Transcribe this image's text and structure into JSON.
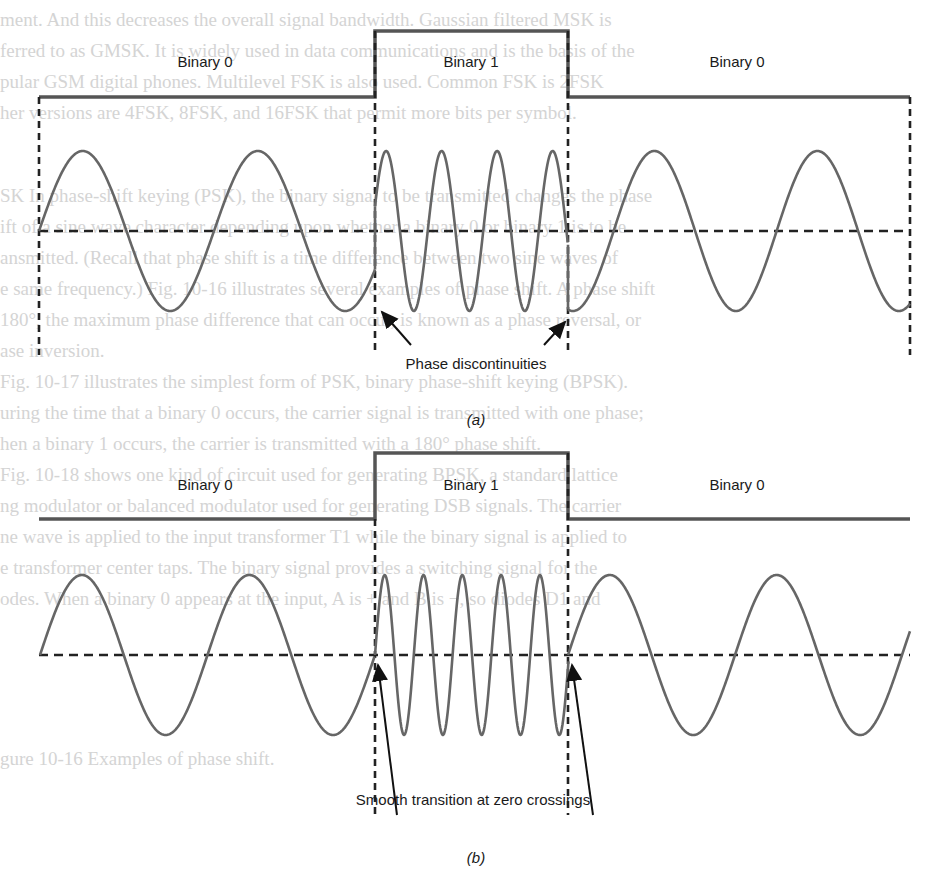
{
  "figure": {
    "colors": {
      "signal_line": "#555555",
      "dashed_line": "#222222",
      "wave": "#666666",
      "arrow": "#111111",
      "bleed_text": "#d4d4d4"
    },
    "panel_a": {
      "caption": "(a)",
      "caption_pos": [
        476,
        420
      ],
      "labels": [
        {
          "text": "Binary 0",
          "x": 205,
          "y": 62
        },
        {
          "text": "Binary 1",
          "x": 471,
          "y": 62
        },
        {
          "text": "Binary 0",
          "x": 737,
          "y": 62
        }
      ],
      "annotation": {
        "text": "Phase discontinuities",
        "x": 476,
        "y": 364
      },
      "binary_signal": {
        "x": [
          39,
          375,
          568,
          910
        ],
        "low_y": 97,
        "high_y": 31
      },
      "zero_line_y": 231,
      "dashed_verticals": [
        {
          "x": 39,
          "y1": 97,
          "y2": 355
        },
        {
          "x": 375,
          "y1": 31,
          "y2": 355
        },
        {
          "x": 568,
          "y1": 31,
          "y2": 355
        },
        {
          "x": 910,
          "y1": 97,
          "y2": 355
        }
      ],
      "amplitude": 80,
      "segments": [
        {
          "x0": 39,
          "x1": 375,
          "period": 175,
          "phase0": 0
        },
        {
          "x0": 375,
          "x1": 568,
          "period": 55.5,
          "phase0": 0.05
        },
        {
          "x0": 568,
          "x1": 910,
          "period": 163,
          "phase0": 0.72
        }
      ],
      "arrows": [
        {
          "from": [
            411,
            345
          ],
          "to": [
            382,
            312
          ]
        },
        {
          "from": [
            544,
            345
          ],
          "to": [
            565,
            322
          ]
        }
      ]
    },
    "panel_b": {
      "caption": "(b)",
      "caption_pos": [
        476,
        858
      ],
      "labels": [
        {
          "text": "Binary 0",
          "x": 205,
          "y": 485
        },
        {
          "text": "Binary 1",
          "x": 471,
          "y": 485
        },
        {
          "text": "Binary 0",
          "x": 737,
          "y": 485
        }
      ],
      "annotation": {
        "text": "Smooth transition at zero crossings",
        "x": 473,
        "y": 800
      },
      "binary_signal": {
        "x": [
          39,
          375,
          568,
          910
        ],
        "low_y": 519,
        "high_y": 453
      },
      "zero_line_y": 655,
      "dashed_verticals": [
        {
          "x": 375,
          "y1": 519,
          "y2": 815
        },
        {
          "x": 568,
          "y1": 453,
          "y2": 815
        }
      ],
      "amplitude": 80,
      "segments": [
        {
          "x0": 40,
          "x1": 375,
          "period": 167.5,
          "phase0": 0
        },
        {
          "x0": 375,
          "x1": 569,
          "period": 38.8,
          "phase0": 0
        },
        {
          "x0": 568,
          "x1": 910,
          "period": 167,
          "phase0": 0
        }
      ],
      "arrows": [
        {
          "from": [
            397,
            815
          ],
          "to": [
            378,
            665
          ]
        },
        {
          "from": [
            593,
            815
          ],
          "to": [
            572,
            665
          ]
        }
      ]
    }
  },
  "background_bleed": {
    "lines": [
      {
        "y": 4,
        "text": "ment. And this decreases the overall signal bandwidth. Gaussian filtered MSK is"
      },
      {
        "y": 35,
        "text": "ferred to as GMSK. It is widely used in data communications and is the basis of the"
      },
      {
        "y": 66,
        "text": "pular GSM digital phones. Multilevel FSK is also used. Common FSK is 2FSK"
      },
      {
        "y": 97,
        "text": "her versions are 4FSK, 8FSK, and 16FSK that permit more bits per symbol."
      },
      {
        "y": 180,
        "text": "SK In phase-shift keying (PSK), the binary signal to be transmitted changes the phase"
      },
      {
        "y": 211,
        "text": "ift of a sine wave character depending upon whether a binary 0 or binary 1 is to be"
      },
      {
        "y": 242,
        "text": "ansmitted. (Recall that phase shift is a time difference between two sine waves of"
      },
      {
        "y": 273,
        "text": "e same frequency.) Fig. 10-16 illustrates several examples of phase shift. A phase shift"
      },
      {
        "y": 304,
        "text": "180°, the maximum phase difference that can occur, is known as a phase reversal, or"
      },
      {
        "y": 335,
        "text": "ase inversion."
      },
      {
        "y": 366,
        "text": "Fig. 10-17 illustrates the simplest form of PSK, binary phase-shift keying (BPSK)."
      },
      {
        "y": 397,
        "text": "uring the time that a binary 0 occurs, the carrier signal is transmitted with one phase;"
      },
      {
        "y": 428,
        "text": "hen a binary 1 occurs, the carrier is transmitted with a 180° phase shift."
      },
      {
        "y": 459,
        "text": "Fig. 10-18 shows one kind of circuit used for generating BPSK, a standard lattice"
      },
      {
        "y": 490,
        "text": "ng modulator or balanced modulator used for generating DSB signals. The carrier"
      },
      {
        "y": 521,
        "text": "ne wave is applied to the input transformer T1 while the binary signal is applied to"
      },
      {
        "y": 552,
        "text": "e transformer center taps. The binary signal provides a switching signal for the"
      },
      {
        "y": 583,
        "text": "odes. When a binary 0 appears at the input, A is + and B is −, so diodes D1 and"
      },
      {
        "y": 743,
        "text": "gure 10-16   Examples of phase shift."
      }
    ]
  }
}
